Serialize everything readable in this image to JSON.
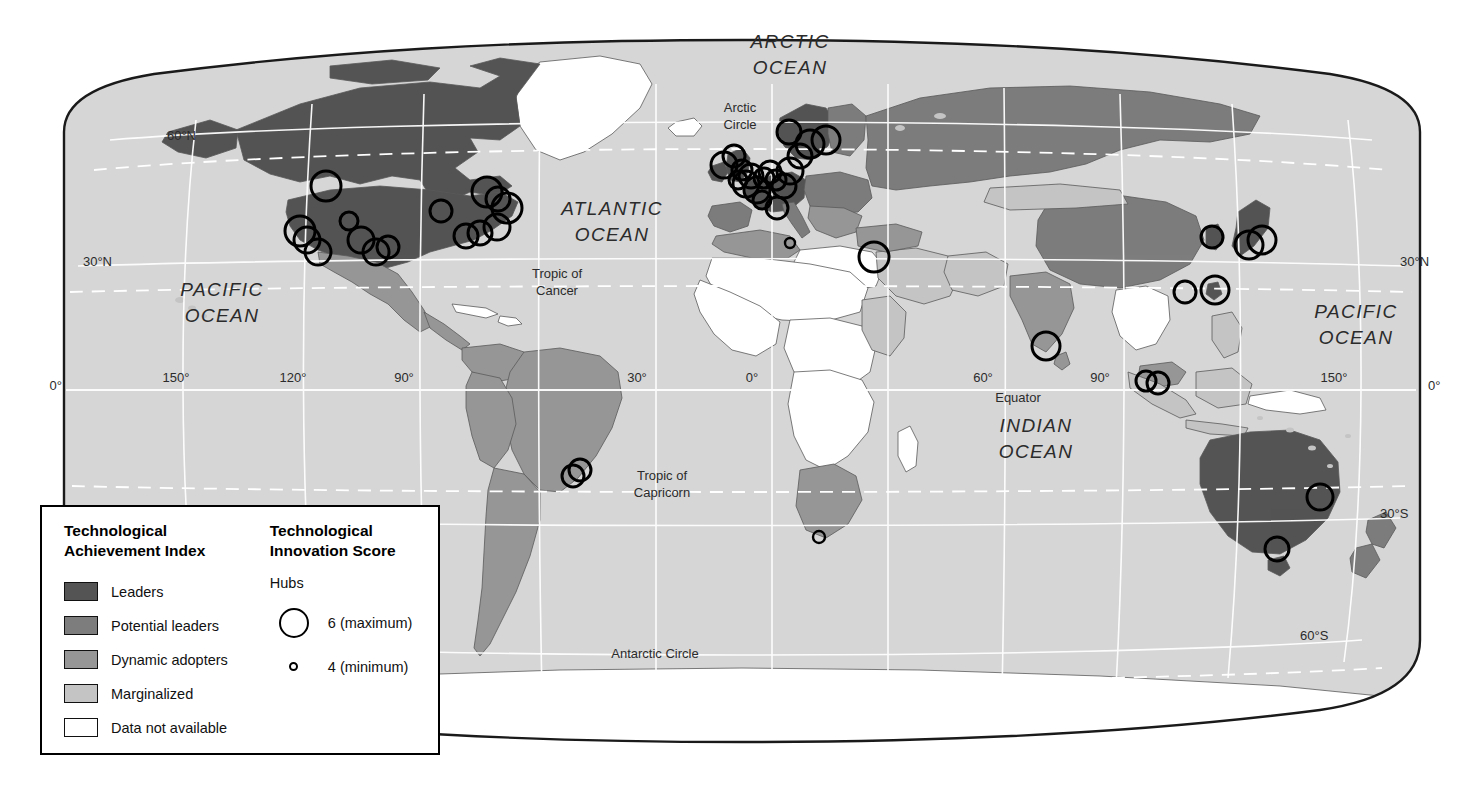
{
  "map": {
    "projection": "robinson",
    "background": "#ffffff",
    "ocean_fill": "#d6d6d6",
    "border_color": "#1a1a1a",
    "graticule_color": "#ffffff",
    "ocean_labels": [
      {
        "name": "arctic-ocean",
        "lines": [
          "ARCTIC",
          "OCEAN"
        ],
        "x": 790,
        "y": 48
      },
      {
        "name": "atlantic-ocean",
        "lines": [
          "ATLANTIC",
          "OCEAN"
        ],
        "x": 612,
        "y": 215
      },
      {
        "name": "pacific-ocean-west",
        "lines": [
          "PACIFIC",
          "OCEAN"
        ],
        "x": 222,
        "y": 296
      },
      {
        "name": "pacific-ocean-east",
        "lines": [
          "PACIFIC",
          "OCEAN"
        ],
        "x": 1356,
        "y": 318
      },
      {
        "name": "indian-ocean",
        "lines": [
          "INDIAN",
          "OCEAN"
        ],
        "x": 1036,
        "y": 432
      }
    ],
    "feature_labels": [
      {
        "name": "arctic-circle",
        "lines": [
          "Arctic",
          "Circle"
        ],
        "x": 740,
        "y": 112
      },
      {
        "name": "tropic-of-cancer",
        "lines": [
          "Tropic of",
          "Cancer"
        ],
        "x": 557,
        "y": 278
      },
      {
        "name": "equator",
        "lines": [
          "Equator"
        ],
        "x": 1018,
        "y": 402
      },
      {
        "name": "tropic-of-capricorn",
        "lines": [
          "Tropic of",
          "Capricorn"
        ],
        "x": 662,
        "y": 480
      },
      {
        "name": "antarctic-circle",
        "lines": [
          "Antarctic Circle"
        ],
        "x": 655,
        "y": 658
      }
    ],
    "latitude_labels": [
      {
        "text": "60°N",
        "x": 196,
        "y": 140,
        "anchor": "end"
      },
      {
        "text": "30°N",
        "x": 112,
        "y": 266,
        "anchor": "end"
      },
      {
        "text": "0°",
        "x": 62,
        "y": 390,
        "anchor": "end"
      },
      {
        "text": "30°N",
        "x": 1400,
        "y": 266,
        "anchor": "start"
      },
      {
        "text": "0°",
        "x": 1428,
        "y": 390,
        "anchor": "start"
      },
      {
        "text": "30°S",
        "x": 1380,
        "y": 518,
        "anchor": "start"
      },
      {
        "text": "60°S",
        "x": 1300,
        "y": 640,
        "anchor": "start"
      }
    ],
    "longitude_labels": [
      {
        "text": "150°",
        "x": 176,
        "y": 382
      },
      {
        "text": "120°",
        "x": 293,
        "y": 382
      },
      {
        "text": "90°",
        "x": 404,
        "y": 382
      },
      {
        "text": "30°",
        "x": 637,
        "y": 382
      },
      {
        "text": "0°",
        "x": 752,
        "y": 382
      },
      {
        "text": "60°",
        "x": 983,
        "y": 382
      },
      {
        "text": "90°",
        "x": 1100,
        "y": 382
      },
      {
        "text": "150°",
        "x": 1334,
        "y": 382
      }
    ]
  },
  "legend": {
    "index": {
      "title": "Technological\nAchievement Index",
      "items": [
        {
          "label": "Leaders",
          "color": "#545454"
        },
        {
          "label": "Potential leaders",
          "color": "#7d7d7d"
        },
        {
          "label": "Dynamic adopters",
          "color": "#969696"
        },
        {
          "label": "Marginalized",
          "color": "#c4c4c4"
        },
        {
          "label": "Data not available",
          "color": "#ffffff"
        }
      ]
    },
    "innovation": {
      "title": "Technological\nInnovation Score",
      "subtitle": "Hubs",
      "items": [
        {
          "label": "6 (maximum)",
          "size": "max"
        },
        {
          "label": "4 (minimum)",
          "size": "min"
        }
      ]
    }
  },
  "chart_data": {
    "type": "map",
    "classes": [
      {
        "name": "Leaders",
        "color": "#545454"
      },
      {
        "name": "Potential leaders",
        "color": "#7d7d7d"
      },
      {
        "name": "Dynamic adopters",
        "color": "#969696"
      },
      {
        "name": "Marginalized",
        "color": "#c4c4c4"
      },
      {
        "name": "Data not available",
        "color": "#ffffff"
      }
    ],
    "hub_scale": {
      "min_score": 4,
      "max_score": 6,
      "min_radius_px": 5,
      "max_radius_px": 15
    },
    "hubs": [
      {
        "name": "Seattle",
        "x": 326,
        "y": 186,
        "r": 15
      },
      {
        "name": "San Francisco",
        "x": 300,
        "y": 231,
        "r": 15
      },
      {
        "name": "Silicon Valley",
        "x": 307,
        "y": 240,
        "r": 13
      },
      {
        "name": "Los Angeles",
        "x": 318,
        "y": 252,
        "r": 13
      },
      {
        "name": "Salt Lake City",
        "x": 349,
        "y": 221,
        "r": 9
      },
      {
        "name": "Denver",
        "x": 361,
        "y": 240,
        "r": 13
      },
      {
        "name": "Albuquerque",
        "x": 376,
        "y": 252,
        "r": 13
      },
      {
        "name": "Austin",
        "x": 388,
        "y": 247,
        "r": 11
      },
      {
        "name": "Chicago",
        "x": 441,
        "y": 211,
        "r": 11
      },
      {
        "name": "Toronto",
        "x": 487,
        "y": 192,
        "r": 15
      },
      {
        "name": "Montreal",
        "x": 498,
        "y": 199,
        "r": 12
      },
      {
        "name": "Boston",
        "x": 507,
        "y": 208,
        "r": 15
      },
      {
        "name": "New York",
        "x": 497,
        "y": 227,
        "r": 13
      },
      {
        "name": "Philadelphia",
        "x": 480,
        "y": 233,
        "r": 12
      },
      {
        "name": "Washington DC",
        "x": 466,
        "y": 236,
        "r": 12
      },
      {
        "name": "Dublin",
        "x": 724,
        "y": 165,
        "r": 13
      },
      {
        "name": "Glasgow",
        "x": 734,
        "y": 156,
        "r": 11
      },
      {
        "name": "Manchester",
        "x": 742,
        "y": 170,
        "r": 10
      },
      {
        "name": "Cambridge UK",
        "x": 751,
        "y": 176,
        "r": 12
      },
      {
        "name": "London",
        "x": 746,
        "y": 184,
        "r": 13
      },
      {
        "name": "Oxford",
        "x": 738,
        "y": 180,
        "r": 9
      },
      {
        "name": "Paris",
        "x": 757,
        "y": 190,
        "r": 13
      },
      {
        "name": "Grenoble",
        "x": 762,
        "y": 200,
        "r": 9
      },
      {
        "name": "Brussels",
        "x": 764,
        "y": 178,
        "r": 10
      },
      {
        "name": "Amsterdam",
        "x": 770,
        "y": 172,
        "r": 11
      },
      {
        "name": "Munich",
        "x": 784,
        "y": 186,
        "r": 12
      },
      {
        "name": "Frankfurt",
        "x": 776,
        "y": 180,
        "r": 10
      },
      {
        "name": "Berlin",
        "x": 790,
        "y": 171,
        "r": 13
      },
      {
        "name": "Stockholm",
        "x": 810,
        "y": 144,
        "r": 14
      },
      {
        "name": "Helsinki",
        "x": 826,
        "y": 140,
        "r": 14
      },
      {
        "name": "Oslo",
        "x": 789,
        "y": 132,
        "r": 12
      },
      {
        "name": "Copenhagen",
        "x": 800,
        "y": 156,
        "r": 12
      },
      {
        "name": "Milan",
        "x": 777,
        "y": 208,
        "r": 11
      },
      {
        "name": "Tunis",
        "x": 790,
        "y": 243,
        "r": 5
      },
      {
        "name": "Tel Aviv",
        "x": 874,
        "y": 257,
        "r": 15
      },
      {
        "name": "Bangalore",
        "x": 1046,
        "y": 346,
        "r": 14
      },
      {
        "name": "Kuala Lumpur",
        "x": 1146,
        "y": 381,
        "r": 10
      },
      {
        "name": "Singapore",
        "x": 1158,
        "y": 383,
        "r": 11
      },
      {
        "name": "Hong Kong",
        "x": 1185,
        "y": 292,
        "r": 11
      },
      {
        "name": "Taipei",
        "x": 1215,
        "y": 290,
        "r": 14
      },
      {
        "name": "Seoul",
        "x": 1212,
        "y": 237,
        "r": 11
      },
      {
        "name": "Osaka",
        "x": 1249,
        "y": 245,
        "r": 14
      },
      {
        "name": "Tokyo",
        "x": 1262,
        "y": 240,
        "r": 14
      },
      {
        "name": "Sao Paulo",
        "x": 573,
        "y": 476,
        "r": 11
      },
      {
        "name": "Rio de Janeiro",
        "x": 580,
        "y": 470,
        "r": 11
      },
      {
        "name": "Cape Town",
        "x": 819,
        "y": 537,
        "r": 6
      },
      {
        "name": "Sydney",
        "x": 1320,
        "y": 497,
        "r": 13
      },
      {
        "name": "Melbourne",
        "x": 1277,
        "y": 549,
        "r": 12
      }
    ]
  }
}
